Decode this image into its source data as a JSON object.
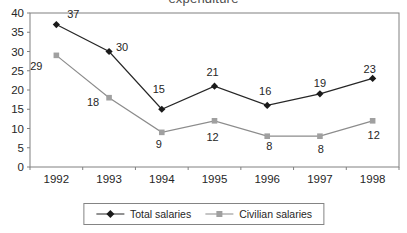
{
  "chart": {
    "title_fragment": "expenditure"
  },
  "chart_data": {
    "type": "line",
    "title": "expenditure",
    "categories": [
      "1992",
      "1993",
      "1994",
      "1995",
      "1996",
      "1997",
      "1998"
    ],
    "series": [
      {
        "name": "Total salaries",
        "values": [
          37,
          30,
          15,
          21,
          16,
          19,
          23
        ],
        "color": "#262626",
        "marker": "diamond",
        "marker_color": "#1a1a1a",
        "label_dx": [
          17,
          13,
          -3,
          -2,
          -2,
          0,
          -3
        ],
        "label_dy": [
          -7,
          -1,
          -16,
          -10,
          -10,
          -7,
          -5
        ]
      },
      {
        "name": "Civilian salaries",
        "values": [
          29,
          18,
          9,
          12,
          8,
          8,
          12
        ],
        "color": "#8c8c8c",
        "marker": "square",
        "marker_color": "#a0a0a0",
        "label_dx": [
          -20,
          -16,
          -3,
          -2,
          2,
          1,
          1
        ],
        "label_dy": [
          15,
          8,
          16,
          20,
          14,
          17,
          18
        ]
      }
    ],
    "xlabel": "",
    "ylabel": "",
    "ylim": [
      0,
      40
    ],
    "ytick_step": 5,
    "grid": false,
    "legend_position": "bottom",
    "axis_color": "#808080",
    "text_color": "#262626",
    "data_label_fontsize": 11,
    "tick_label_fontsize": 11.5
  }
}
